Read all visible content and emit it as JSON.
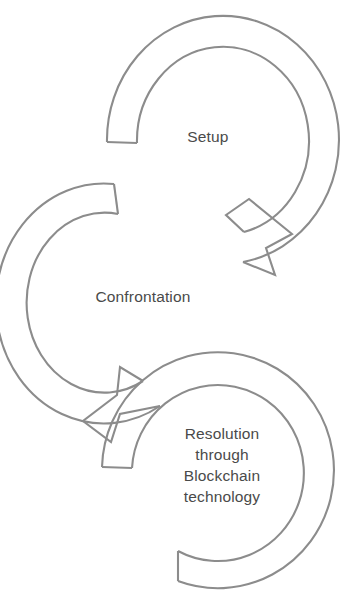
{
  "diagram": {
    "type": "cyclical-process",
    "stroke_color": "#8c8c8c",
    "text_color": "#4a4a4a",
    "background_color": "#ffffff",
    "stages": [
      {
        "id": "setup",
        "order": 1,
        "label": "Setup",
        "icon": "circular-arrow-icon",
        "position": "top-right"
      },
      {
        "id": "confrontation",
        "order": 2,
        "label": "Confrontation",
        "icon": "circular-arrow-icon",
        "position": "middle-left"
      },
      {
        "id": "resolution",
        "order": 3,
        "label": "Resolution\nthrough\nBlockchain\ntechnology",
        "label_lines": [
          "Resolution",
          "through",
          "Blockchain",
          "technology"
        ],
        "icon": "circular-arrow-icon",
        "position": "bottom-right"
      }
    ],
    "connectors": [
      {
        "id": "setup-to-confrontation",
        "from": "setup",
        "to": "confrontation",
        "icon": "arrowhead-icon"
      },
      {
        "id": "confrontation-to-resolution",
        "from": "confrontation",
        "to": "resolution",
        "icon": "arrowhead-icon"
      }
    ]
  }
}
